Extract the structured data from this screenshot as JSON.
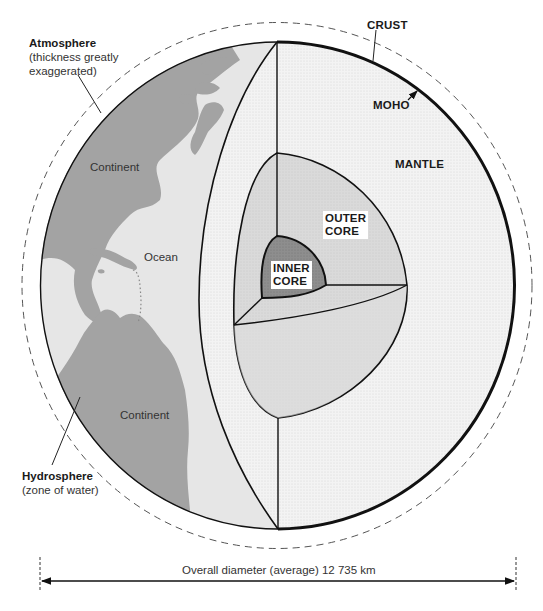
{
  "diagram": {
    "labels": {
      "atmosphere": {
        "title": "Atmosphere",
        "note_line1": "(thickness greatly",
        "note_line2": "exaggerated)"
      },
      "crust": "CRUST",
      "moho": "MOHO",
      "mantle": "MANTLE",
      "outer_core_line1": "OUTER",
      "outer_core_line2": "CORE",
      "inner_core_line1": "INNER",
      "inner_core_line2": "CORE",
      "continent_north": "Continent",
      "ocean": "Ocean",
      "continent_south": "Continent",
      "hydrosphere": {
        "title": "Hydrosphere",
        "note": "(zone of water)"
      }
    },
    "scale_bar": {
      "label": "Overall diameter (average) 12 735 km"
    },
    "colors": {
      "ocean": "#e6e6e6",
      "continent": "#a3a3a3",
      "mantle": "#f1f1f1",
      "outer_core": "#d9d9d9",
      "inner_core": "#8c8c8c",
      "outline": "#111111",
      "dashed": "#555555"
    }
  }
}
